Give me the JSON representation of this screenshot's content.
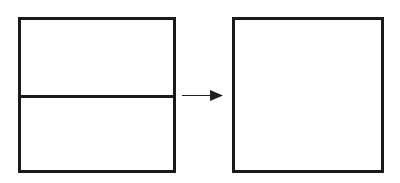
{
  "canvas": {
    "width": 400,
    "height": 183,
    "background_color": "#ffffff",
    "stroke_color": "#1a1a1a"
  },
  "diagram": {
    "title": "",
    "type": "shape-transformation"
  },
  "left_figure": {
    "name": "divided-rectangle",
    "x": 18,
    "y": 17,
    "width": 158,
    "height": 156,
    "stroke_width": 3,
    "stroke_color": "#1a1a1a",
    "fill_color": "#ffffff",
    "label": "",
    "divider": {
      "name": "horizontal-divider",
      "y": 96,
      "x_start": 18,
      "x_end": 176,
      "stroke_width": 3,
      "stroke_color": "#1a1a1a",
      "label": ""
    },
    "regions": [
      {
        "name": "upper-region",
        "label": ""
      },
      {
        "name": "lower-region",
        "label": ""
      }
    ]
  },
  "arrow": {
    "name": "transformation-arrow",
    "direction": "right",
    "shaft_start_x": 182,
    "shaft_end_x": 212,
    "y": 95.5,
    "shaft_width": 1.6,
    "head_tip_x": 223,
    "head_base_x": 210,
    "head_half_height": 5.5,
    "color": "#1f1f1f",
    "label": ""
  },
  "right_figure": {
    "name": "plain-square",
    "x": 232,
    "y": 17,
    "width": 152,
    "height": 156,
    "stroke_width": 3,
    "stroke_color": "#1a1a1a",
    "fill_color": "#ffffff",
    "label": ""
  }
}
